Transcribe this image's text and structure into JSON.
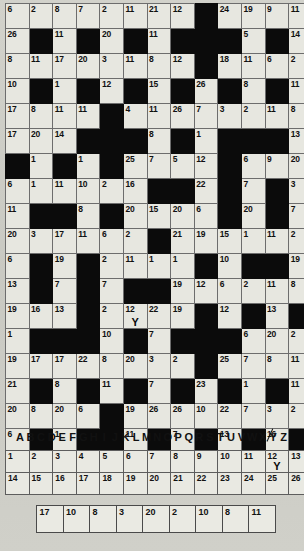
{
  "puzzle": {
    "type": "codeword",
    "columns": 13,
    "rows": 17,
    "grid": [
      [
        {
          "n": "6"
        },
        {
          "n": "2"
        },
        {
          "n": "8"
        },
        {
          "n": "7"
        },
        {
          "n": "2"
        },
        {
          "n": "11"
        },
        {
          "n": "21"
        },
        {
          "n": "12"
        },
        {
          "b": true
        },
        {
          "n": "24"
        },
        {
          "n": "19"
        },
        {
          "n": "9"
        },
        {
          "n": "11"
        }
      ],
      [
        {
          "n": "26"
        },
        {
          "b": true
        },
        {
          "n": "11"
        },
        {
          "b": true
        },
        {
          "n": "20"
        },
        {
          "b": true
        },
        {
          "n": "11"
        },
        {
          "b": true
        },
        {
          "b": true
        },
        {
          "b": true
        },
        {
          "n": "5"
        },
        {
          "b": true
        },
        {
          "n": "14"
        }
      ],
      [
        {
          "n": "8"
        },
        {
          "n": "11"
        },
        {
          "n": "17"
        },
        {
          "n": "20"
        },
        {
          "n": "3"
        },
        {
          "n": "11"
        },
        {
          "n": "8"
        },
        {
          "n": "12"
        },
        {
          "b": true
        },
        {
          "n": "18"
        },
        {
          "n": "11"
        },
        {
          "n": "6"
        },
        {
          "n": "2"
        }
      ],
      [
        {
          "n": "10"
        },
        {
          "b": true
        },
        {
          "n": "1"
        },
        {
          "b": true
        },
        {
          "n": "12"
        },
        {
          "b": true
        },
        {
          "n": "15"
        },
        {
          "b": true
        },
        {
          "n": "26"
        },
        {
          "b": true
        },
        {
          "n": "8"
        },
        {
          "b": true
        },
        {
          "n": "11"
        }
      ],
      [
        {
          "n": "17"
        },
        {
          "n": "8"
        },
        {
          "n": "11"
        },
        {
          "n": "11"
        },
        {
          "b": true
        },
        {
          "n": "4"
        },
        {
          "n": "11"
        },
        {
          "n": "26"
        },
        {
          "n": "7"
        },
        {
          "n": "3"
        },
        {
          "n": "2"
        },
        {
          "n": "11"
        },
        {
          "n": "8"
        }
      ],
      [
        {
          "n": "17"
        },
        {
          "n": "20"
        },
        {
          "n": "14"
        },
        {
          "b": true
        },
        {
          "b": true
        },
        {
          "b": true
        },
        {
          "n": "8"
        },
        {
          "b": true
        },
        {
          "n": "1"
        },
        {
          "b": true
        },
        {
          "b": true
        },
        {
          "b": true
        },
        {
          "n": "13"
        }
      ],
      [
        {
          "b": true
        },
        {
          "n": "1"
        },
        {
          "b": true
        },
        {
          "n": "1"
        },
        {
          "b": true
        },
        {
          "n": "25"
        },
        {
          "n": "7"
        },
        {
          "n": "5"
        },
        {
          "n": "12"
        },
        {
          "b": true
        },
        {
          "n": "6"
        },
        {
          "n": "9"
        },
        {
          "n": "20"
        }
      ],
      [
        {
          "n": "6"
        },
        {
          "n": "1"
        },
        {
          "n": "11"
        },
        {
          "n": "10"
        },
        {
          "n": "2"
        },
        {
          "n": "16"
        },
        {
          "b": true
        },
        {
          "b": true
        },
        {
          "n": "22"
        },
        {
          "b": true
        },
        {
          "n": "7"
        },
        {
          "b": true
        },
        {
          "n": "3"
        }
      ],
      [
        {
          "n": "11"
        },
        {
          "b": true
        },
        {
          "b": true
        },
        {
          "n": "8"
        },
        {
          "b": true
        },
        {
          "n": "20"
        },
        {
          "n": "15"
        },
        {
          "n": "20"
        },
        {
          "n": "6"
        },
        {
          "b": true
        },
        {
          "n": "20"
        },
        {
          "b": true
        },
        {
          "n": "7"
        }
      ],
      [
        {
          "n": "20"
        },
        {
          "n": "3"
        },
        {
          "n": "17"
        },
        {
          "n": "11"
        },
        {
          "n": "6"
        },
        {
          "n": "2"
        },
        {
          "b": true
        },
        {
          "n": "21"
        },
        {
          "n": "19"
        },
        {
          "n": "15"
        },
        {
          "n": "1"
        },
        {
          "n": "11"
        },
        {
          "n": "2"
        }
      ],
      [
        {
          "n": "6"
        },
        {
          "b": true
        },
        {
          "n": "19"
        },
        {
          "b": true
        },
        {
          "n": "2"
        },
        {
          "n": "11"
        },
        {
          "n": "1"
        },
        {
          "n": "1"
        },
        {
          "b": true
        },
        {
          "n": "10"
        },
        {
          "b": true
        },
        {
          "b": true
        },
        {
          "n": "19"
        }
      ],
      [
        {
          "n": "13"
        },
        {
          "b": true
        },
        {
          "n": "7"
        },
        {
          "b": true
        },
        {
          "n": "7"
        },
        {
          "b": true
        },
        {
          "b": true
        },
        {
          "n": "19"
        },
        {
          "n": "12"
        },
        {
          "n": "6"
        },
        {
          "n": "2"
        },
        {
          "n": "11"
        },
        {
          "n": "8"
        }
      ],
      [
        {
          "n": "19"
        },
        {
          "n": "16"
        },
        {
          "n": "13"
        },
        {
          "b": true
        },
        {
          "n": "2"
        },
        {
          "n": "12",
          "l": "Y"
        },
        {
          "n": "22"
        },
        {
          "n": "19"
        },
        {
          "b": true
        },
        {
          "n": "12"
        },
        {
          "b": true
        },
        {
          "n": "13"
        },
        {
          "b": true
        }
      ],
      [
        {
          "n": "1"
        },
        {
          "b": true
        },
        {
          "b": true
        },
        {
          "b": true
        },
        {
          "n": "10"
        },
        {
          "b": true
        },
        {
          "n": "7"
        },
        {
          "b": true
        },
        {
          "b": true
        },
        {
          "b": true
        },
        {
          "n": "6"
        },
        {
          "n": "20"
        },
        {
          "n": "2"
        }
      ],
      [
        {
          "n": "19"
        },
        {
          "n": "17"
        },
        {
          "n": "17"
        },
        {
          "n": "22"
        },
        {
          "n": "8"
        },
        {
          "n": "20"
        },
        {
          "n": "3"
        },
        {
          "n": "2"
        },
        {
          "b": true
        },
        {
          "n": "25"
        },
        {
          "n": "7"
        },
        {
          "n": "8"
        },
        {
          "n": "11"
        }
      ],
      [
        {
          "n": "21"
        },
        {
          "b": true
        },
        {
          "n": "8"
        },
        {
          "b": true
        },
        {
          "n": "11"
        },
        {
          "b": true
        },
        {
          "n": "7"
        },
        {
          "b": true
        },
        {
          "n": "23"
        },
        {
          "b": true
        },
        {
          "n": "1"
        },
        {
          "b": true
        },
        {
          "n": "11"
        }
      ],
      [
        {
          "n": "20"
        },
        {
          "n": "8"
        },
        {
          "n": "20"
        },
        {
          "n": "6"
        },
        {
          "b": true
        },
        {
          "n": "19"
        },
        {
          "n": "26"
        },
        {
          "n": "26"
        },
        {
          "n": "10"
        },
        {
          "n": "22"
        },
        {
          "n": "7"
        },
        {
          "n": "3"
        },
        {
          "n": "2"
        }
      ],
      [
        {
          "n": "6"
        },
        {
          "b": true
        },
        {
          "n": "1"
        },
        {
          "b": true
        },
        {
          "b": true
        },
        {
          "n": "11"
        },
        {
          "b": true
        },
        {
          "n": "7"
        },
        {
          "b": true
        },
        {
          "n": "13"
        },
        {
          "b": true
        },
        {
          "n": "16"
        },
        {
          "b": true
        }
      ],
      [
        {
          "n": "2"
        },
        {
          "n": "7"
        },
        {
          "n": "1"
        },
        {
          "n": "9"
        },
        {
          "b": true
        },
        {
          "n": "1"
        },
        {
          "n": "7"
        },
        {
          "n": "4"
        },
        {
          "n": "12"
        },
        {
          "n": "1"
        },
        {
          "n": "20"
        },
        {
          "n": "9"
        },
        {
          "n": "11"
        }
      ]
    ]
  },
  "alphabet": [
    {
      "letter": "A",
      "used": false
    },
    {
      "letter": "B",
      "used": false
    },
    {
      "letter": "C",
      "used": false
    },
    {
      "letter": "D",
      "used": false
    },
    {
      "letter": "E",
      "used": false
    },
    {
      "letter": "F",
      "used": false
    },
    {
      "letter": "G",
      "used": false
    },
    {
      "letter": "H",
      "used": false
    },
    {
      "letter": "I",
      "used": false
    },
    {
      "letter": "J",
      "used": false
    },
    {
      "letter": "K",
      "used": false
    },
    {
      "letter": "L",
      "used": false
    },
    {
      "letter": "M",
      "used": false
    },
    {
      "letter": "N",
      "used": false
    },
    {
      "letter": "O",
      "used": false
    },
    {
      "letter": "P",
      "used": false
    },
    {
      "letter": "Q",
      "used": false
    },
    {
      "letter": "R",
      "used": false
    },
    {
      "letter": "S",
      "used": false
    },
    {
      "letter": "T",
      "used": false
    },
    {
      "letter": "U",
      "used": false
    },
    {
      "letter": "V",
      "used": false
    },
    {
      "letter": "W",
      "used": false
    },
    {
      "letter": "X",
      "used": false
    },
    {
      "letter": "Y",
      "used": true
    },
    {
      "letter": "Z",
      "used": false
    }
  ],
  "key_table": {
    "rows": [
      [
        {
          "n": "1",
          "l": ""
        },
        {
          "n": "2",
          "l": ""
        },
        {
          "n": "3",
          "l": ""
        },
        {
          "n": "4",
          "l": ""
        },
        {
          "n": "5",
          "l": ""
        },
        {
          "n": "6",
          "l": ""
        },
        {
          "n": "7",
          "l": ""
        },
        {
          "n": "8",
          "l": ""
        },
        {
          "n": "9",
          "l": ""
        },
        {
          "n": "10",
          "l": ""
        },
        {
          "n": "11",
          "l": ""
        },
        {
          "n": "12",
          "l": "Y"
        },
        {
          "n": "13",
          "l": ""
        }
      ],
      [
        {
          "n": "14",
          "l": ""
        },
        {
          "n": "15",
          "l": ""
        },
        {
          "n": "16",
          "l": ""
        },
        {
          "n": "17",
          "l": ""
        },
        {
          "n": "18",
          "l": ""
        },
        {
          "n": "19",
          "l": ""
        },
        {
          "n": "20",
          "l": ""
        },
        {
          "n": "21",
          "l": ""
        },
        {
          "n": "22",
          "l": ""
        },
        {
          "n": "23",
          "l": ""
        },
        {
          "n": "24",
          "l": ""
        },
        {
          "n": "25",
          "l": ""
        },
        {
          "n": "26",
          "l": ""
        }
      ]
    ]
  },
  "answer_strip": {
    "cells": [
      {
        "n": "17",
        "l": ""
      },
      {
        "n": "10",
        "l": ""
      },
      {
        "n": "8",
        "l": ""
      },
      {
        "n": "3",
        "l": ""
      },
      {
        "n": "20",
        "l": ""
      },
      {
        "n": "2",
        "l": ""
      },
      {
        "n": "10",
        "l": ""
      },
      {
        "n": "8",
        "l": ""
      },
      {
        "n": "11",
        "l": ""
      }
    ]
  },
  "colors": {
    "page_background": "#cfcfc8",
    "cell_fill": "#e7e7e0",
    "block_fill": "#0b0b0b",
    "grid_line": "#6d6d6d",
    "text": "#101010"
  }
}
